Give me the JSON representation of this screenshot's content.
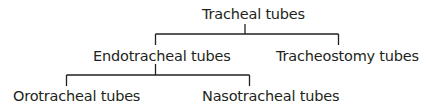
{
  "diagram": {
    "type": "tree",
    "root": "Tracheal tubes",
    "nodes": {
      "root": {
        "label": "Tracheal tubes"
      },
      "endotracheal": {
        "label": "Endotracheal tubes"
      },
      "tracheostomy": {
        "label": "Tracheostomy tubes"
      },
      "orotracheal": {
        "label": "Orotracheal tubes"
      },
      "nasotracheal": {
        "label": "Nasotracheal tubes"
      }
    },
    "edges": [
      [
        "Tracheal tubes",
        "Endotracheal tubes"
      ],
      [
        "Tracheal tubes",
        "Tracheostomy tubes"
      ],
      [
        "Endotracheal tubes",
        "Orotracheal tubes"
      ],
      [
        "Endotracheal tubes",
        "Nasotracheal tubes"
      ]
    ],
    "colors": {
      "text": "#231f20",
      "lines": "#231f20",
      "background": "#ffffff"
    }
  }
}
